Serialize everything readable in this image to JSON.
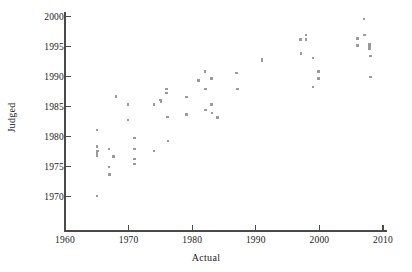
{
  "chart_data": {
    "type": "scatter",
    "title": "",
    "xlabel": "Actual",
    "ylabel": "Judged",
    "xlim": [
      1958,
      2012
    ],
    "ylim": [
      1969,
      2001
    ],
    "grid": false,
    "legend": null,
    "xticks": [
      1960,
      1970,
      1980,
      1990,
      2000,
      2010
    ],
    "yticks": [
      1970,
      1975,
      1980,
      1985,
      1990,
      1995,
      2000
    ],
    "xticklabels": [
      "1960",
      "1970",
      "1980",
      "1990",
      "2000",
      "2010"
    ],
    "yticklabels": [
      "1970",
      "1975",
      "1980",
      "1985",
      "1990",
      "1995",
      "2000"
    ],
    "marker": "square",
    "marker_color": "#9a9a9a",
    "marker_size": 2.6,
    "axis_color": "#4a4a4a",
    "n_points": 56,
    "points": [
      {
        "x": 1965.0,
        "y": 1970.1
      },
      {
        "x": 1965.0,
        "y": 1981.1
      },
      {
        "x": 1965.0,
        "y": 1978.4
      },
      {
        "x": 1965.0,
        "y": 1977.3
      },
      {
        "x": 1965.0,
        "y": 1976.9
      },
      {
        "x": 1965.1,
        "y": 1977.6
      },
      {
        "x": 1966.9,
        "y": 1978.0
      },
      {
        "x": 1966.9,
        "y": 1975.0
      },
      {
        "x": 1967.0,
        "y": 1973.7
      },
      {
        "x": 1967.6,
        "y": 1976.7
      },
      {
        "x": 1968.0,
        "y": 1986.7
      },
      {
        "x": 1969.9,
        "y": 1985.4
      },
      {
        "x": 1969.9,
        "y": 1982.8
      },
      {
        "x": 1970.9,
        "y": 1979.8
      },
      {
        "x": 1970.9,
        "y": 1978.0
      },
      {
        "x": 1970.9,
        "y": 1976.3
      },
      {
        "x": 1970.9,
        "y": 1975.5
      },
      {
        "x": 1974.0,
        "y": 1985.4
      },
      {
        "x": 1974.0,
        "y": 1977.6
      },
      {
        "x": 1975.0,
        "y": 1986.1
      },
      {
        "x": 1975.1,
        "y": 1985.8
      },
      {
        "x": 1976.0,
        "y": 1988.0
      },
      {
        "x": 1976.0,
        "y": 1987.3
      },
      {
        "x": 1976.1,
        "y": 1983.3
      },
      {
        "x": 1976.2,
        "y": 1979.3
      },
      {
        "x": 1979.1,
        "y": 1986.6
      },
      {
        "x": 1979.1,
        "y": 1983.7
      },
      {
        "x": 1981.0,
        "y": 1989.4
      },
      {
        "x": 1982.0,
        "y": 1990.9
      },
      {
        "x": 1982.1,
        "y": 1988.0
      },
      {
        "x": 1982.1,
        "y": 1984.5
      },
      {
        "x": 1983.0,
        "y": 1989.7
      },
      {
        "x": 1983.0,
        "y": 1985.4
      },
      {
        "x": 1983.1,
        "y": 1984.0
      },
      {
        "x": 1984.0,
        "y": 1983.2
      },
      {
        "x": 1987.0,
        "y": 1990.6
      },
      {
        "x": 1987.1,
        "y": 1988.0
      },
      {
        "x": 1991.0,
        "y": 1993.0
      },
      {
        "x": 1991.0,
        "y": 1992.7
      },
      {
        "x": 1997.0,
        "y": 1996.2
      },
      {
        "x": 1997.1,
        "y": 1993.9
      },
      {
        "x": 1997.9,
        "y": 1997.0
      },
      {
        "x": 1997.9,
        "y": 1996.2
      },
      {
        "x": 1999.0,
        "y": 1993.1
      },
      {
        "x": 1999.0,
        "y": 1988.3
      },
      {
        "x": 1999.9,
        "y": 1990.9
      },
      {
        "x": 1999.9,
        "y": 1989.7
      },
      {
        "x": 2006.0,
        "y": 1996.4
      },
      {
        "x": 2006.0,
        "y": 1995.2
      },
      {
        "x": 2007.0,
        "y": 1999.6
      },
      {
        "x": 2007.1,
        "y": 1997.0
      },
      {
        "x": 2007.9,
        "y": 1995.4
      },
      {
        "x": 2007.9,
        "y": 1995.0
      },
      {
        "x": 2007.9,
        "y": 1994.6
      },
      {
        "x": 2008.0,
        "y": 1993.5
      },
      {
        "x": 2008.0,
        "y": 1990.0
      }
    ]
  }
}
